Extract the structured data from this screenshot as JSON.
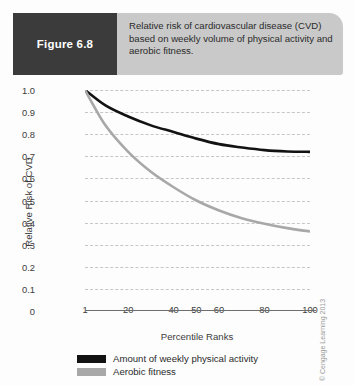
{
  "figure": {
    "tag": "Figure 6.8",
    "caption": "Relative risk of cardiovascular disease (CVD) based on weekly volume of physical activity and aerobic fitness.",
    "credit": "© Cengage Learning 2013"
  },
  "colors": {
    "tag_background": "#3b3b3b",
    "band_background": "#c9c9c9",
    "series_activity": "#121212",
    "series_fitness": "#a8a8a8",
    "gridline": "#c6c6c6",
    "axis": "#6e6e6e"
  },
  "chart_data": {
    "type": "line",
    "title": "Relative risk of cardiovascular disease (CVD) based on weekly volume of physical activity and aerobic fitness.",
    "xlabel": "Percentile Ranks",
    "ylabel": "Relative Risk of CVD",
    "xlim": [
      1,
      100
    ],
    "ylim": [
      0,
      1.0
    ],
    "grid": true,
    "legend_position": "below-axes",
    "xticks": [
      1,
      20,
      40,
      50,
      60,
      80,
      100
    ],
    "xtick_labels": [
      "1",
      "20",
      "40",
      "50",
      "60",
      "80",
      "100"
    ],
    "yticks": [
      0,
      0.1,
      0.2,
      0.3,
      0.4,
      0.5,
      0.6,
      0.7,
      0.8,
      0.9,
      1.0
    ],
    "ytick_labels": [
      "0",
      "0.1",
      "0.2",
      "0.3",
      "0.4",
      "0.5",
      "0.6",
      "0.7",
      "0.8",
      "0.9",
      "1.0"
    ],
    "x": [
      1,
      10,
      20,
      30,
      40,
      50,
      60,
      70,
      80,
      90,
      100
    ],
    "series": [
      {
        "name": "Amount of weekly physical activity",
        "color": "#121212",
        "values": [
          1.0,
          0.93,
          0.88,
          0.84,
          0.81,
          0.78,
          0.755,
          0.74,
          0.728,
          0.722,
          0.72
        ]
      },
      {
        "name": "Aerobic fitness",
        "color": "#a8a8a8",
        "values": [
          1.0,
          0.84,
          0.72,
          0.63,
          0.56,
          0.5,
          0.455,
          0.42,
          0.395,
          0.375,
          0.36
        ]
      }
    ]
  },
  "legend": {
    "items": [
      {
        "label": "Amount of weekly physical activity",
        "color": "#121212"
      },
      {
        "label": "Aerobic fitness",
        "color": "#a8a8a8"
      }
    ]
  }
}
